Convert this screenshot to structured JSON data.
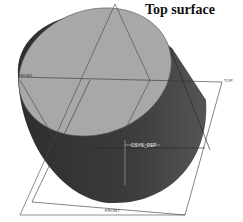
{
  "diagram": {
    "title": "Top surface",
    "datum_labels": {
      "front_left": "FRONT",
      "top_right": "TOP",
      "front_bottom": "FRONT"
    },
    "csys_label": "CSYS_DEF",
    "colors": {
      "top_face": "#a9a9a9",
      "side_face": "#3a3a3a",
      "side_face_light": "#5a5a5a",
      "edge": "#444444",
      "datum_plane": "#555555",
      "background": "#ffffff"
    }
  }
}
